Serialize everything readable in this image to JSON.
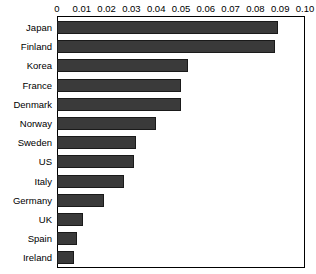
{
  "chart_data": {
    "type": "bar",
    "orientation": "horizontal",
    "title": "",
    "xlabel": "",
    "ylabel": "",
    "xlim": [
      0,
      0.1
    ],
    "grid": false,
    "legend": null,
    "axis_position": "top",
    "tick_labels": [
      "0",
      "0.01",
      "0.02",
      "0.03",
      "0.04",
      "0.05",
      "0.06",
      "0.07",
      "0.08",
      "0.09",
      "0.10"
    ],
    "ticks": [
      0,
      0.01,
      0.02,
      0.03,
      0.04,
      0.05,
      0.06,
      0.07,
      0.08,
      0.09,
      0.1
    ],
    "categories": [
      "Japan",
      "Finland",
      "Korea",
      "France",
      "Denmark",
      "Norway",
      "Sweden",
      "US",
      "Italy",
      "Germany",
      "UK",
      "Spain",
      "Ireland"
    ],
    "values": [
      0.089,
      0.088,
      0.053,
      0.05,
      0.05,
      0.04,
      0.032,
      0.031,
      0.027,
      0.019,
      0.0105,
      0.008,
      0.0068
    ],
    "bar_color": "#3a3a3a",
    "bar_edge_color": "#1a1a1a"
  }
}
